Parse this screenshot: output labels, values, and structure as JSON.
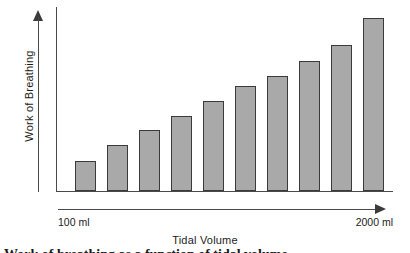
{
  "chart_data": {
    "type": "bar",
    "title": "",
    "subtitle": "",
    "xlabel": "Tidal Volume",
    "ylabel": "Work of Breathing",
    "categories": [
      "100 ml",
      "",
      "",
      "",
      "",
      "",
      "",
      "",
      "",
      "2000 ml"
    ],
    "values": [
      30,
      46,
      61,
      75,
      90,
      105,
      115,
      130,
      146,
      173
    ],
    "ylim": [
      0,
      184
    ],
    "grid": false,
    "legend": null,
    "axis_tick_labels": {
      "x_left": "100 ml",
      "x_right": "2000 ml"
    }
  },
  "axes": {
    "y_label": "Work of Breathing",
    "x_label": "Tidal Volume",
    "x_min_label": "100 ml",
    "x_max_label": "2000 ml",
    "y_arrow_icon": "arrow-up-icon",
    "x_arrow_icon": "arrow-right-icon"
  },
  "colors": {
    "bar_fill": "#a9a9a9",
    "bar_border": "#3a3a3a",
    "axis": "#4a4a4a",
    "text": "#1c1c1c",
    "background": "#ffffff"
  },
  "caption": {
    "partial_text": "Work of breathing as a function of tidal volume"
  }
}
